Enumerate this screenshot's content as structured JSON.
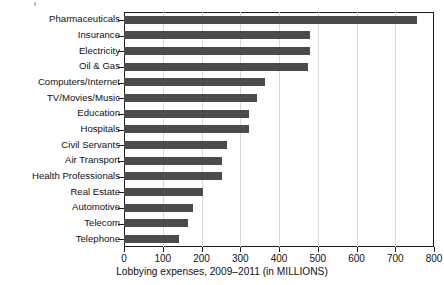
{
  "chart_data": {
    "type": "bar",
    "orientation": "horizontal",
    "title": "",
    "xlabel": "Lobbying expenses, 2009–2011 (in MILLIONS)",
    "ylabel": "",
    "xlim": [
      0,
      800
    ],
    "xticks": [
      0,
      100,
      200,
      300,
      400,
      500,
      600,
      700,
      800
    ],
    "xtick_labels": [
      "0",
      "100",
      "200",
      "300",
      "400",
      "500",
      "600",
      "700",
      "800"
    ],
    "grid": "vertical",
    "legend": "none",
    "bar_color": "#4b4b4b",
    "categories": [
      "Pharmaceuticals",
      "Insurance",
      "Electricity",
      "Oil & Gas",
      "Computers/Internet",
      "TV/Movies/Music",
      "Education",
      "Hospitals",
      "Civil Servants",
      "Air Transport",
      "Health Professionals",
      "Real Estate",
      "Automotive",
      "Telecom",
      "Telephone"
    ],
    "values": [
      755,
      480,
      480,
      475,
      365,
      343,
      322,
      323,
      267,
      253,
      252,
      205,
      178,
      165,
      142
    ]
  }
}
